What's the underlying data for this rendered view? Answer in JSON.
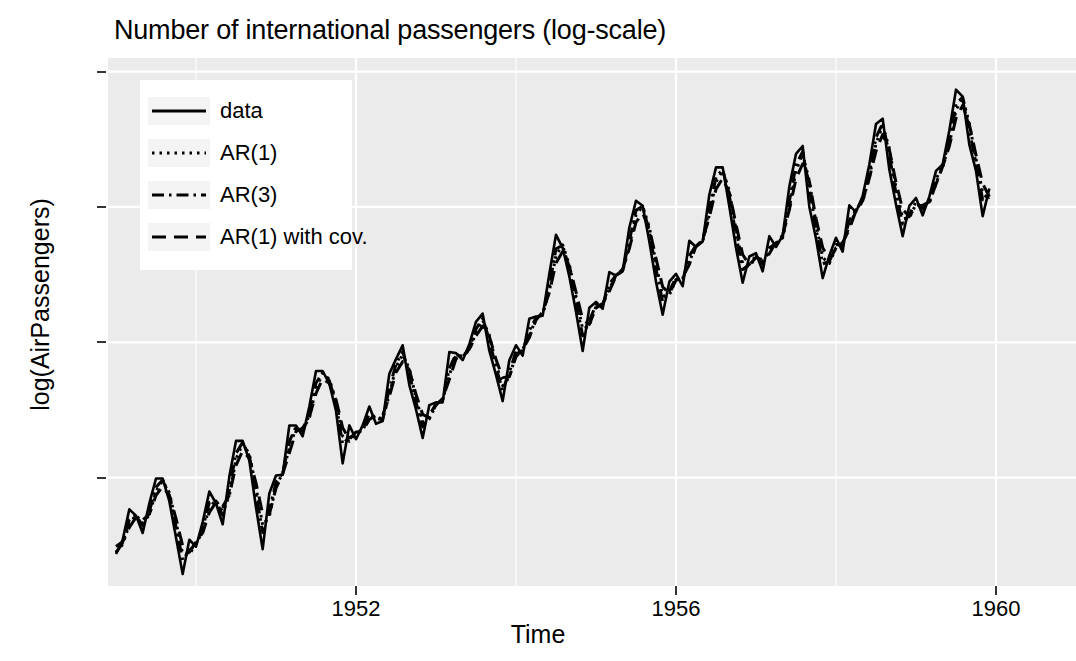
{
  "chart_data": {
    "type": "line",
    "title": "Number of international passengers (log-scale)",
    "xlabel": "Time",
    "ylabel": "log(AirPassengers)",
    "grid": true,
    "legend_position": "top-left-inside",
    "xlim": [
      1948.9,
      1961.0
    ],
    "ylim": [
      4.6,
      6.55
    ],
    "xticks": [
      1952,
      1956,
      1960
    ],
    "xtick_labels": [
      "1952",
      "1956",
      "1960"
    ],
    "yticks": [
      5.0,
      5.5,
      6.0,
      6.5
    ],
    "ytick_labels": [
      "5.0",
      "5.5",
      "6.0",
      "6.5"
    ],
    "x_start": 1949.0,
    "x_step": 0.0833333,
    "series": [
      {
        "name": "data",
        "style": "solid",
        "color": "#000000",
        "values": [
          4.718,
          4.771,
          4.883,
          4.86,
          4.796,
          4.905,
          4.997,
          4.997,
          4.913,
          4.779,
          4.644,
          4.771,
          4.745,
          4.836,
          4.949,
          4.905,
          4.828,
          5.004,
          5.136,
          5.136,
          5.063,
          4.89,
          4.736,
          4.942,
          5.008,
          5.011,
          5.193,
          5.193,
          5.153,
          5.263,
          5.394,
          5.394,
          5.347,
          5.247,
          5.053,
          5.193,
          5.142,
          5.193,
          5.263,
          5.199,
          5.209,
          5.384,
          5.438,
          5.489,
          5.342,
          5.252,
          5.147,
          5.268,
          5.278,
          5.278,
          5.464,
          5.46,
          5.434,
          5.493,
          5.576,
          5.606,
          5.469,
          5.38,
          5.283,
          5.434,
          5.489,
          5.451,
          5.587,
          5.595,
          5.598,
          5.753,
          5.897,
          5.849,
          5.743,
          5.613,
          5.468,
          5.628,
          5.649,
          5.624,
          5.759,
          5.746,
          5.762,
          5.924,
          6.023,
          6.004,
          5.872,
          5.724,
          5.602,
          5.724,
          5.753,
          5.707,
          5.875,
          5.852,
          5.872,
          6.045,
          6.146,
          6.146,
          6.001,
          5.849,
          5.72,
          5.817,
          5.829,
          5.762,
          5.892,
          5.852,
          5.894,
          6.075,
          6.196,
          6.225,
          6.001,
          5.883,
          5.737,
          5.82,
          5.886,
          5.835,
          6.006,
          5.981,
          6.04,
          6.157,
          6.306,
          6.326,
          6.138,
          6.009,
          5.892,
          6.004,
          6.033,
          5.969,
          6.038,
          6.133,
          6.157,
          6.282,
          6.433,
          6.407,
          6.23,
          6.133,
          5.966,
          6.068
        ]
      },
      {
        "name": "AR(1)",
        "style": "dotted",
        "color": "#000000"
      },
      {
        "name": "AR(3)",
        "style": "dotdash",
        "color": "#000000"
      },
      {
        "name": "AR(1) with cov.",
        "style": "dashed",
        "color": "#000000"
      }
    ],
    "legend_entries": [
      {
        "label": "data",
        "style": "solid"
      },
      {
        "label": "AR(1)",
        "style": "dotted"
      },
      {
        "label": "AR(3)",
        "style": "dotdash"
      },
      {
        "label": "AR(1) with cov.",
        "style": "dashed"
      }
    ],
    "colors": {
      "panel_background": "#ebebeb",
      "gridline": "#ffffff",
      "line": "#000000",
      "legend_background": "#ffffff",
      "tick_mark": "#333333",
      "figure_background": "#ffffff"
    }
  }
}
